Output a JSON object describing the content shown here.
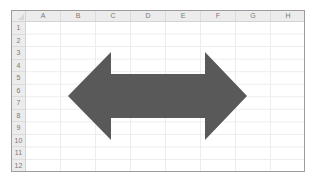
{
  "spreadsheet": {
    "columns": [
      "A",
      "B",
      "C",
      "D",
      "E",
      "F",
      "G",
      "H"
    ],
    "rows": [
      "1",
      "2",
      "3",
      "4",
      "5",
      "6",
      "7",
      "8",
      "9",
      "10",
      "11",
      "12"
    ],
    "colors": {
      "header_bg": "#ececec",
      "header_text": "#7a7a7a",
      "gridline": "#ededed",
      "frame": "#9c9c9c"
    }
  },
  "shape": {
    "type": "left-right-arrow",
    "fill": "#595959",
    "points": "68,96 111,52 111,74 205,74 205,52 247,96 205,140 205,118 111,118 111,140"
  }
}
